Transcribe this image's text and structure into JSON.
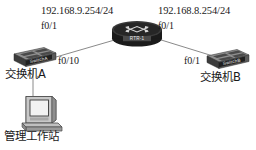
{
  "diagram": {
    "background_color": "#ffffff",
    "line_color": "#8a8a8a",
    "text_color": "#1a1a1a"
  },
  "labels": {
    "left_ip": "192.168.9.254/24",
    "left_router_port": "f0/1",
    "right_ip": "192.168.8.254/24",
    "right_router_port": "f0/1",
    "switch_a_port": "f0/10",
    "switch_b_port": "f0/1"
  },
  "nodes": {
    "router": {
      "device_label": "RTR-1",
      "type": "router-icon"
    },
    "switch_a": {
      "device_label": "SwitchA",
      "caption": "交换机A",
      "type": "switch-icon"
    },
    "switch_b": {
      "device_label": "SwitchB",
      "caption": "交换机B",
      "type": "switch-icon"
    },
    "workstation": {
      "caption": "管理工作站",
      "type": "workstation-icon"
    }
  }
}
